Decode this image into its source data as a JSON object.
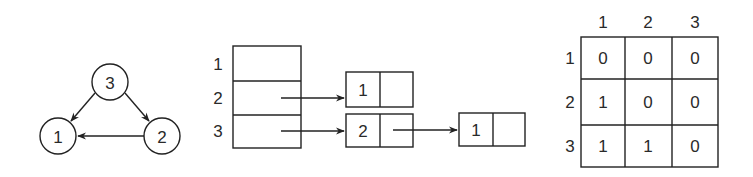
{
  "graph": {
    "nodes": [
      {
        "id": "1",
        "label": "1",
        "cx": 58,
        "cy": 136
      },
      {
        "id": "2",
        "label": "2",
        "cx": 162,
        "cy": 136
      },
      {
        "id": "3",
        "label": "3",
        "cx": 110,
        "cy": 82
      }
    ],
    "edges": [
      {
        "from": "3",
        "to": "1"
      },
      {
        "from": "3",
        "to": "2"
      },
      {
        "from": "2",
        "to": "1"
      }
    ]
  },
  "adjacency_list": {
    "row_labels": [
      "1",
      "2",
      "3"
    ],
    "lists": [
      [],
      [
        "1"
      ],
      [
        "2",
        "1"
      ]
    ]
  },
  "adjacency_matrix": {
    "col_headers": [
      "1",
      "2",
      "3"
    ],
    "row_headers": [
      "1",
      "2",
      "3"
    ],
    "cells": [
      [
        "0",
        "0",
        "0"
      ],
      [
        "1",
        "0",
        "0"
      ],
      [
        "1",
        "1",
        "0"
      ]
    ]
  }
}
